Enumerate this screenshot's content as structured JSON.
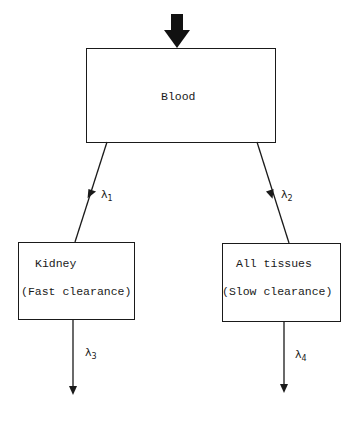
{
  "diagram": {
    "type": "compartment-model",
    "input_arrow": "bold-down-arrow",
    "nodes": {
      "blood": {
        "label": "Blood"
      },
      "kidney": {
        "label": "Kidney",
        "sublabel": "(Fast clearance)"
      },
      "tissues": {
        "label": "All tissues",
        "sublabel": "(Slow clearance)"
      }
    },
    "edges": [
      {
        "from": "blood",
        "to": "kidney",
        "symbol": "λ",
        "subscript": "1"
      },
      {
        "from": "blood",
        "to": "tissues",
        "symbol": "λ",
        "subscript": "2"
      },
      {
        "from": "kidney",
        "to": "out",
        "symbol": "λ",
        "subscript": "3"
      },
      {
        "from": "tissues",
        "to": "out",
        "symbol": "λ",
        "subscript": "4"
      }
    ],
    "colors": {
      "line": "#1a1a1a",
      "background": "#ffffff"
    }
  }
}
